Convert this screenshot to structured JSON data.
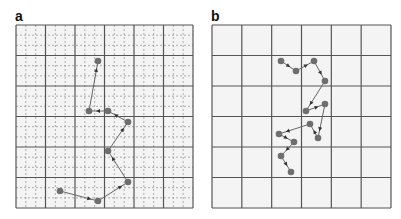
{
  "figure": {
    "panels": [
      {
        "label": "a",
        "box": {
          "x": 16,
          "y": 25,
          "w": 177,
          "h": 183
        },
        "grid": {
          "cells": 6,
          "minor_subdivisions": 3,
          "minor_style": "dashed"
        },
        "path": [
          [
            98,
            61
          ],
          [
            89,
            111
          ],
          [
            108,
            111
          ],
          [
            128,
            122
          ],
          [
            108,
            151
          ],
          [
            128,
            182
          ],
          [
            98,
            201
          ],
          [
            60,
            191
          ]
        ],
        "arrow_direction": "reverse"
      },
      {
        "label": "b",
        "box": {
          "x": 212,
          "y": 25,
          "w": 179,
          "h": 183
        },
        "grid": {
          "cells": 6,
          "minor_subdivisions": 0,
          "minor_style": "none"
        },
        "path": [
          [
            281,
            61
          ],
          [
            296,
            71
          ],
          [
            314,
            61
          ],
          [
            325,
            81
          ],
          [
            306,
            111
          ],
          [
            325,
            104
          ],
          [
            318,
            138
          ],
          [
            310,
            124
          ],
          [
            279,
            134
          ],
          [
            294,
            142
          ],
          [
            281,
            156
          ],
          [
            291,
            172
          ]
        ],
        "arrow_direction": "forward"
      }
    ]
  },
  "colors": {
    "background": "#f4f4f4",
    "major_grid": "#555555",
    "minor_grid": "#9a9a9a",
    "path_line": "#666666",
    "point_fill": "#6e6e6e",
    "arrow": "#333333"
  }
}
